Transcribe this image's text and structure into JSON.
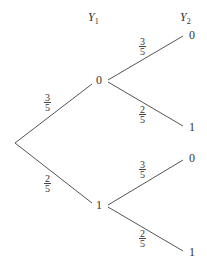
{
  "diagram": {
    "type": "probability-tree",
    "headers": {
      "level1": {
        "var": "Y",
        "sub": "1"
      },
      "level2": {
        "var": "Y",
        "sub": "2"
      }
    },
    "level1_nodes": [
      {
        "value": "0",
        "prob": {
          "num": "3",
          "den": "5"
        }
      },
      {
        "value": "1",
        "prob": {
          "num": "2",
          "den": "5"
        }
      }
    ],
    "level2_nodes": [
      {
        "parent": "0",
        "value": "0",
        "prob": {
          "num": "3",
          "den": "5"
        }
      },
      {
        "parent": "0",
        "value": "1",
        "prob": {
          "num": "2",
          "den": "5"
        }
      },
      {
        "parent": "1",
        "value": "0",
        "prob": {
          "num": "3",
          "den": "5"
        }
      },
      {
        "parent": "1",
        "value": "1",
        "prob": {
          "num": "2",
          "den": "5"
        }
      }
    ],
    "line_color": "#555555"
  }
}
